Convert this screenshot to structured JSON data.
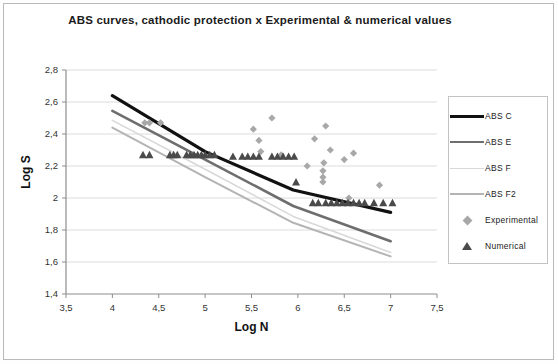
{
  "figure": {
    "title": "ABS curves, cathodic protection x Experimental & numerical values",
    "background": "#ffffff",
    "frame_color": "#b9b9b9"
  },
  "legend": {
    "position": "right",
    "entries": [
      {
        "label": "ABS C",
        "type": "line",
        "color": "#111111",
        "width": 3.2
      },
      {
        "label": "ABS E",
        "type": "line",
        "color": "#6e6e6e",
        "width": 2.6
      },
      {
        "label": "ABS F",
        "type": "line",
        "color": "#d8d8d8",
        "width": 1.6
      },
      {
        "label": "ABS F2",
        "type": "line",
        "color": "#b4b4b4",
        "width": 2.0
      },
      {
        "label": "Experimental",
        "type": "marker",
        "marker": "diamond",
        "color": "#a8a8a8"
      },
      {
        "label": "Numerical",
        "type": "marker",
        "marker": "triangle",
        "color": "#4a4a4a"
      }
    ]
  },
  "chart_data": {
    "type": "line",
    "title": "ABS curves, cathodic protection x Experimental & numerical values",
    "xlabel": "Log N",
    "ylabel": "Log S",
    "xlim": [
      3.5,
      7.5
    ],
    "ylim": [
      1.4,
      2.8
    ],
    "xticks": [
      3.5,
      4,
      4.5,
      5,
      5.5,
      6,
      6.5,
      7,
      7.5
    ],
    "xtick_labels": [
      "3,5",
      "4",
      "4,5",
      "5",
      "5,5",
      "6",
      "6,5",
      "7",
      "7,5"
    ],
    "yticks": [
      1.4,
      1.6,
      1.8,
      2.0,
      2.2,
      2.4,
      2.6,
      2.8
    ],
    "ytick_labels": [
      "1,4",
      "1,6",
      "1,8",
      "2",
      "2,2",
      "2,4",
      "2,6",
      "2,8"
    ],
    "grid": "horizontal",
    "decimal_separator": ",",
    "series": [
      {
        "name": "ABS C",
        "type": "line",
        "color": "#111111",
        "width": 3.2,
        "x": [
          4.0,
          5.0,
          5.95,
          7.0
        ],
        "y": [
          2.64,
          2.29,
          2.05,
          1.91
        ]
      },
      {
        "name": "ABS E",
        "type": "line",
        "color": "#6e6e6e",
        "width": 2.6,
        "x": [
          4.0,
          5.0,
          5.95,
          7.0
        ],
        "y": [
          2.545,
          2.24,
          1.95,
          1.73
        ]
      },
      {
        "name": "ABS F",
        "type": "line",
        "color": "#d8d8d8",
        "width": 1.6,
        "x": [
          4.0,
          5.0,
          5.95,
          7.0
        ],
        "y": [
          2.485,
          2.18,
          1.885,
          1.66
        ]
      },
      {
        "name": "ABS F2",
        "type": "line",
        "color": "#b4b4b4",
        "width": 2.0,
        "x": [
          4.0,
          5.0,
          5.95,
          7.0
        ],
        "y": [
          2.44,
          2.13,
          1.845,
          1.635
        ]
      },
      {
        "name": "Experimental",
        "type": "scatter",
        "marker": "diamond",
        "color": "#a8a8a8",
        "points": [
          [
            4.35,
            2.47
          ],
          [
            4.4,
            2.47
          ],
          [
            4.52,
            2.47
          ],
          [
            5.52,
            2.43
          ],
          [
            5.58,
            2.36
          ],
          [
            5.72,
            2.5
          ],
          [
            5.6,
            2.29
          ],
          [
            6.18,
            2.37
          ],
          [
            6.3,
            2.45
          ],
          [
            6.35,
            2.3
          ],
          [
            6.28,
            2.22
          ],
          [
            6.27,
            2.17
          ],
          [
            6.27,
            2.13
          ],
          [
            6.27,
            2.1
          ],
          [
            6.5,
            2.24
          ],
          [
            6.6,
            2.28
          ],
          [
            6.88,
            2.08
          ],
          [
            6.55,
            2.0
          ],
          [
            6.1,
            2.2
          ],
          [
            5.82,
            2.27
          ]
        ]
      },
      {
        "name": "Numerical",
        "type": "scatter",
        "marker": "triangle",
        "color": "#4a4a4a",
        "points": [
          [
            4.33,
            2.27
          ],
          [
            4.4,
            2.27
          ],
          [
            4.62,
            2.27
          ],
          [
            4.66,
            2.27
          ],
          [
            4.7,
            2.27
          ],
          [
            4.8,
            2.27
          ],
          [
            4.84,
            2.27
          ],
          [
            4.88,
            2.27
          ],
          [
            4.92,
            2.27
          ],
          [
            4.96,
            2.27
          ],
          [
            5.0,
            2.27
          ],
          [
            5.05,
            2.27
          ],
          [
            5.1,
            2.27
          ],
          [
            5.3,
            2.26
          ],
          [
            5.4,
            2.26
          ],
          [
            5.46,
            2.26
          ],
          [
            5.52,
            2.26
          ],
          [
            5.58,
            2.26
          ],
          [
            5.72,
            2.26
          ],
          [
            5.78,
            2.26
          ],
          [
            5.84,
            2.26
          ],
          [
            5.9,
            2.26
          ],
          [
            5.96,
            2.26
          ],
          [
            6.3,
            1.97
          ],
          [
            6.36,
            1.97
          ],
          [
            6.42,
            1.97
          ],
          [
            6.48,
            1.97
          ],
          [
            6.54,
            1.97
          ],
          [
            6.6,
            1.97
          ],
          [
            6.66,
            1.97
          ],
          [
            6.72,
            1.97
          ],
          [
            6.82,
            1.97
          ],
          [
            6.92,
            1.97
          ],
          [
            7.02,
            1.97
          ],
          [
            6.16,
            1.97
          ],
          [
            6.22,
            1.97
          ],
          [
            5.98,
            2.1
          ]
        ]
      }
    ]
  }
}
